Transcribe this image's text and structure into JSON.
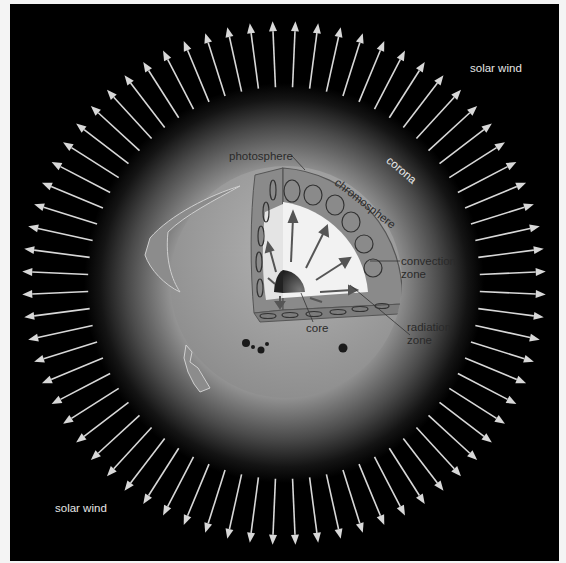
{
  "diagram": {
    "center": [
      284,
      283
    ],
    "arrow_count": 72,
    "arrow_inner_radius": 196,
    "arrow_outer_radius": 262,
    "colors": {
      "background": "#000000",
      "frame": "#f4f4f4",
      "arrow": "#d8d8d8",
      "corona_inner": "#a8a8a8",
      "sun_disc": "#9c9c9c",
      "radiation_zone": "#f2f2f2",
      "convection_zone": "#8a8a8a",
      "core": "#1e1e1e",
      "label_dark": "#2a2a2a",
      "label_light": "#e6e6e6"
    }
  },
  "labels": {
    "solar_wind_top": "solar wind",
    "solar_wind_bottom": "solar wind",
    "corona": "corona",
    "photosphere": "photosphere",
    "chromosphere": "chromosphere",
    "convection_zone_1": "convection",
    "convection_zone_2": "zone",
    "radiation_zone_1": "radiation",
    "radiation_zone_2": "zone",
    "core": "core"
  }
}
